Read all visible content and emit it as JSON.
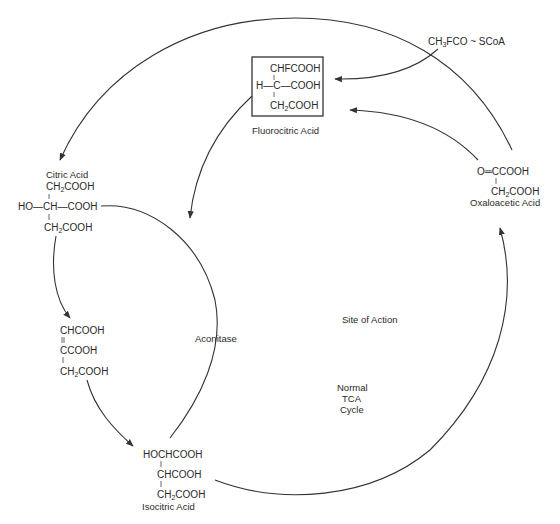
{
  "diagram": {
    "reagent": {
      "prefix": "CH",
      "sub": "3",
      "suffix": "FCO ~ SCoA"
    },
    "fluorocitric_acid": {
      "name": "Fluorocitric Acid",
      "line1": "CHFCOOH",
      "line2_left": "H—C—COOH",
      "line3_prefix": "CH",
      "line3_sub": "2",
      "line3_suffix": "COOH"
    },
    "citric_acid": {
      "name": "Citric Acid",
      "line1_prefix": "CH",
      "line1_sub": "2",
      "line1_suffix": "COOH",
      "line2": "HO—CH—COOH",
      "line3_prefix": "CH",
      "line3_sub": "2",
      "line3_suffix": "COOH"
    },
    "cis_aconitic_acid": {
      "line1": "CHCOOH",
      "line2": "CCOOH",
      "line3_prefix": "CH",
      "line3_sub": "2",
      "line3_suffix": "COOH"
    },
    "isocitric_acid": {
      "name": "Isocitric Acid",
      "line1": "HOCHCOOH",
      "line2": "CHCOOH",
      "line3_prefix": "CH",
      "line3_sub": "2",
      "line3_suffix": "COOH"
    },
    "oxaloacetic_acid": {
      "name": "Oxaloacetic Acid",
      "line1": "O═CCOOH",
      "line2_prefix": "CH",
      "line2_sub": "2",
      "line2_suffix": "COOH"
    },
    "enzyme_label": "Aconitase",
    "site_label": "Site of Action",
    "cycle_label": [
      "Normal",
      "TCA",
      "Cycle"
    ]
  },
  "colors": {
    "ink": "#2a2a2a",
    "background": "#ffffff"
  }
}
